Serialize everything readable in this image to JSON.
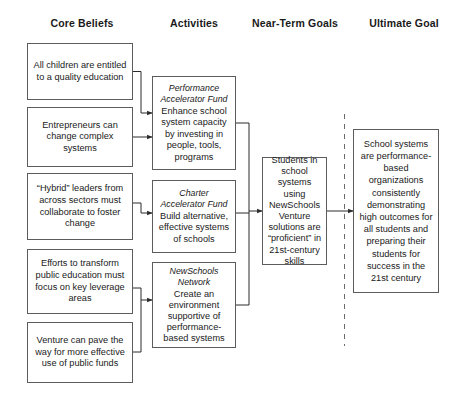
{
  "diagram": {
    "columns": [
      {
        "id": "core-beliefs",
        "label": "Core Beliefs"
      },
      {
        "id": "activities",
        "label": "Activities"
      },
      {
        "id": "near-term-goals",
        "label": "Near-Term Goals"
      },
      {
        "id": "ultimate-goal",
        "label": "Ultimate Goal"
      }
    ],
    "core_beliefs": [
      {
        "text": "All children are entitled to a quality education"
      },
      {
        "text": "Entrepreneurs can change complex systems"
      },
      {
        "text": "“Hybrid” leaders from across sectors must collaborate to foster change"
      },
      {
        "text": "Efforts to transform public education must focus on key leverage areas"
      },
      {
        "text": "Venture can pave the way for more effective use of public funds"
      }
    ],
    "activities": [
      {
        "title": "Performance Accelerator Fund",
        "text": "Enhance school system capacity by investing in people, tools, programs"
      },
      {
        "title": "Charter Accelerator Fund",
        "text": "Build alternative, effective systems of schools"
      },
      {
        "title": "NewSchools Network",
        "text": "Create an environment supportive of performance-based systems"
      }
    ],
    "near_term_goals": [
      {
        "text": "Students in school systems using NewSchools Venture solutions are “proficient” in 21st-century skills"
      }
    ],
    "ultimate_goal": [
      {
        "text": "School systems are performance-based organizations consistently demonstrating high outcomes for all students and preparing their students for success in the 21st century"
      }
    ],
    "colors": {
      "border": "#5c5c5c",
      "text": "#1a1a1a",
      "connector": "#2b2b2b",
      "divider": "#6b6b6b",
      "background": "#ffffff"
    }
  }
}
